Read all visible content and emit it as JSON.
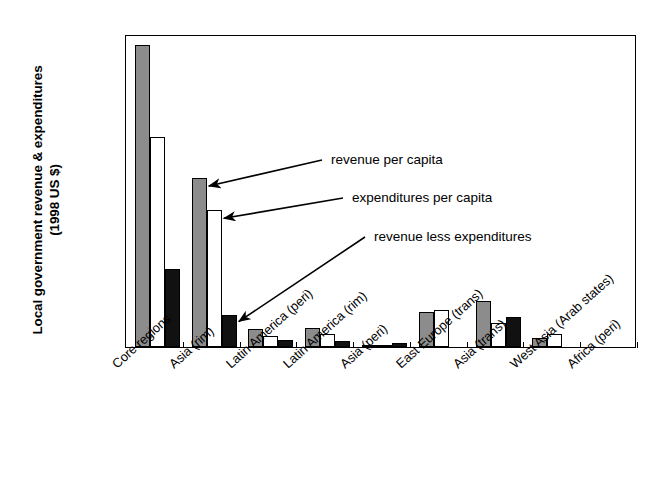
{
  "chart_data": {
    "type": "bar",
    "title": "",
    "xlabel": "",
    "ylabel": "Local government revenue & expenditures (1998 US $)",
    "ylabel_line1": "Local government revenue & expenditures",
    "ylabel_line2": "(1998 US $)",
    "ylim": [
      0,
      3000
    ],
    "ytick_step": 500,
    "yticks": [
      "3000",
      "2500",
      "2000",
      "1500",
      "1000",
      "500",
      "0"
    ],
    "grid": false,
    "legend_position": "none",
    "categories": [
      "Core regions",
      "Asia (rim)",
      "Latin America (peri)",
      "Latin America (rim)",
      "Asia (peri)",
      "East Europe (trans)",
      "Asia (trans)",
      "West Asia (Arab states)",
      "Africa (peri)"
    ],
    "series": [
      {
        "name": "revenue per capita",
        "color": "#8c8c8c",
        "values": [
          2890,
          1620,
          170,
          180,
          10,
          340,
          440,
          85,
          0
        ]
      },
      {
        "name": "expenditures per capita",
        "color": "#ffffff",
        "values": [
          2010,
          1310,
          110,
          120,
          5,
          355,
          230,
          120,
          0
        ]
      },
      {
        "name": "revenue less expenditures",
        "color": "#111111",
        "values": [
          750,
          310,
          65,
          60,
          40,
          0,
          290,
          0,
          0
        ]
      }
    ],
    "annotations": [
      {
        "text": "revenue per capita",
        "target_series": "revenue per capita",
        "target_category": "Asia (rim)"
      },
      {
        "text": "expenditures per capita",
        "target_series": "expenditures per capita",
        "target_category": "Asia (rim)"
      },
      {
        "text": "revenue less expenditures",
        "target_series": "revenue less expenditures",
        "target_category": "Asia (rim)"
      }
    ]
  }
}
